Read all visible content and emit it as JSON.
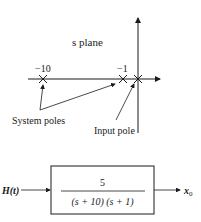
{
  "splane": {
    "title": "s plane",
    "pole_labels": [
      "−10",
      "−1"
    ],
    "system_poles_label": "System poles",
    "input_pole_label": "Input pole",
    "poles": [
      -10,
      -1,
      0
    ]
  },
  "block": {
    "input_label": "H(t)",
    "numerator": "5",
    "denominator": "(s + 10) (s + 1)",
    "output_label": "x",
    "output_subscript": "0"
  },
  "colors": {
    "line": "#1a1a1a",
    "background": "#ffffff"
  }
}
